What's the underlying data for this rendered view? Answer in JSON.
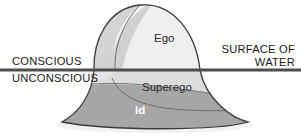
{
  "diagram": {
    "canvas": {
      "width": 301,
      "height": 136,
      "background": "#ffffff"
    },
    "waterline": {
      "label_above": "CONSCIOUS",
      "label_below": "UNCONSCIOUS",
      "right_label_line1": "SURFACE OF",
      "right_label_line2": "WATER",
      "y": 70,
      "color": "#4d4d4d",
      "thickness": 3
    },
    "regions": [
      {
        "key": "ego",
        "label": "Ego",
        "fill": "#efefef",
        "text_color": "#2b2b2b"
      },
      {
        "key": "shoulder",
        "label": "",
        "fill": "#d4d4d4",
        "text_color": "#2b2b2b"
      },
      {
        "key": "superego",
        "label": "Superego",
        "fill": "#dcdcdc",
        "text_color": "#2b2b2b"
      },
      {
        "key": "id",
        "label": "Id",
        "fill": "#a6a6a6",
        "text_color": "#ffffff"
      }
    ],
    "outline_color": "#3a3a3a",
    "shadow_color": "#efefef"
  }
}
